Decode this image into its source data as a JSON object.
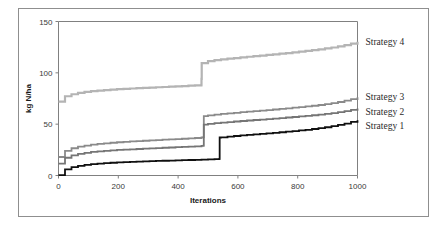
{
  "figure": {
    "background_color": "#ffffff",
    "frame_color": "#8f8f8f"
  },
  "chart_data": {
    "type": "line",
    "title": "",
    "xlabel": "Iterations",
    "ylabel": "kg N/ha",
    "xlim": [
      0,
      1000
    ],
    "ylim": [
      0,
      150
    ],
    "xticks": [
      0,
      200,
      400,
      600,
      800,
      1000
    ],
    "yticks": [
      0,
      50,
      100,
      150
    ],
    "xtick_labels": [
      "0",
      "200",
      "400",
      "600",
      "800",
      "1000"
    ],
    "ytick_labels": [
      "0",
      "50",
      "100",
      "150"
    ],
    "grid": false,
    "legend_position": "right-inline-labels",
    "series": [
      {
        "name": "Strategy 4",
        "color": "#b4b4b4",
        "stroke_width": 2.2,
        "label_x": 1045,
        "label_y": 130,
        "x": [
          0,
          10,
          20,
          35,
          55,
          80,
          110,
          145,
          185,
          230,
          280,
          330,
          380,
          420,
          455,
          478,
          479,
          500,
          540,
          590,
          650,
          710,
          770,
          830,
          880,
          925,
          955,
          975,
          990,
          1000
        ],
        "y": [
          72,
          75,
          77,
          78.5,
          80,
          81.2,
          82.2,
          83.1,
          83.9,
          84.6,
          85.3,
          86,
          86.6,
          87.2,
          87.8,
          88.6,
          109.5,
          111.5,
          113,
          114.5,
          116.2,
          117.8,
          119.5,
          121.5,
          123.3,
          125.2,
          126.8,
          128.2,
          129.4,
          130.3
        ]
      },
      {
        "name": "Strategy 3",
        "color": "#8a8a8a",
        "stroke_width": 1.8,
        "label_x": 1045,
        "label_y": 76,
        "x": [
          0,
          8,
          18,
          32,
          52,
          78,
          108,
          145,
          185,
          230,
          280,
          330,
          380,
          420,
          455,
          485,
          486,
          505,
          545,
          595,
          655,
          715,
          775,
          835,
          885,
          925,
          955,
          975,
          990,
          1000
        ],
        "y": [
          18,
          21,
          23.5,
          25.5,
          27.3,
          28.8,
          30.1,
          31.2,
          32.2,
          33,
          33.8,
          34.6,
          35.3,
          35.9,
          36.5,
          37.3,
          57.8,
          58.8,
          60,
          61.3,
          62.8,
          64.2,
          65.8,
          67.5,
          69.2,
          71,
          72.8,
          74.2,
          75.4,
          76.3
        ]
      },
      {
        "name": "Strategy 2",
        "color": "#757575",
        "stroke_width": 1.8,
        "label_x": 1045,
        "label_y": 62,
        "x": [
          0,
          8,
          18,
          32,
          52,
          78,
          108,
          145,
          185,
          230,
          280,
          330,
          380,
          420,
          455,
          485,
          486,
          505,
          545,
          595,
          655,
          715,
          775,
          835,
          885,
          925,
          955,
          975,
          990,
          1000
        ],
        "y": [
          11.5,
          14.5,
          16.8,
          18.7,
          20.3,
          21.7,
          22.9,
          23.9,
          24.7,
          25.4,
          26.1,
          26.8,
          27.4,
          27.9,
          28.4,
          29.1,
          49.5,
          50.5,
          51.6,
          52.8,
          54.1,
          55.4,
          56.8,
          58.3,
          59.8,
          61.3,
          62.7,
          63.8,
          64.6,
          65.2
        ]
      },
      {
        "name": "Strategy 1",
        "color": "#101010",
        "stroke_width": 1.8,
        "label_x": 1045,
        "label_y": 48,
        "x": [
          0,
          8,
          18,
          32,
          52,
          78,
          108,
          145,
          185,
          230,
          280,
          330,
          380,
          425,
          470,
          510,
          538,
          539,
          560,
          600,
          655,
          715,
          775,
          835,
          885,
          925,
          955,
          975,
          990,
          1000
        ],
        "y": [
          0.3,
          3.2,
          5.4,
          7.2,
          8.8,
          10.1,
          11.1,
          11.9,
          12.6,
          13.2,
          13.7,
          14.2,
          14.6,
          15,
          15.4,
          15.8,
          16.1,
          37,
          37.8,
          38.8,
          40.1,
          41.5,
          43,
          44.8,
          46.7,
          48.6,
          50.5,
          51.9,
          53,
          53.8
        ]
      }
    ]
  }
}
